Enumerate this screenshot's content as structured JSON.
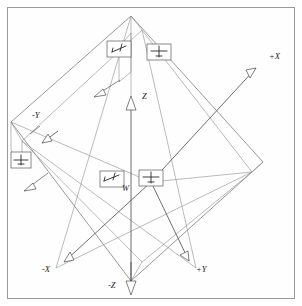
{
  "figure": {
    "background_color": "#ffffff",
    "border_color": "#9a9a9a",
    "line_color": "#6f6f6f",
    "axis_color": "#4a4a4a",
    "text_color": "#1a1a1a"
  },
  "axes": [
    {
      "id": "plus-x",
      "label": "+X",
      "sign": "+",
      "name": "X",
      "direction": "upper-right",
      "tip": [
        263,
        62
      ],
      "origin": [
        151,
        182
      ],
      "label_pos": [
        271,
        58
      ]
    },
    {
      "id": "minus-x",
      "label": "-X",
      "sign": "-",
      "name": "X",
      "direction": "lower-left",
      "tip": [
        56,
        268
      ],
      "origin": [
        151,
        182
      ],
      "label_pos": [
        44,
        271
      ]
    },
    {
      "id": "plus-y",
      "label": "+Y",
      "sign": "+",
      "name": "Y",
      "direction": "lower-right",
      "tip": [
        196,
        268
      ],
      "origin": [
        151,
        182
      ],
      "label_pos": [
        198,
        271
      ]
    },
    {
      "id": "minus-y",
      "label": "-Y",
      "sign": "-",
      "name": "Y",
      "direction": "upper-left",
      "tip": [
        40,
        126
      ],
      "origin": [
        151,
        182
      ],
      "label_pos": [
        33,
        114
      ]
    },
    {
      "id": "plus-z",
      "label": "Z",
      "sign": "+",
      "name": "Z",
      "direction": "up",
      "tip": [
        131,
        96
      ],
      "origin": [
        131,
        280
      ],
      "label_pos": [
        143,
        97
      ]
    },
    {
      "id": "minus-z",
      "label": "-Z",
      "sign": "-",
      "name": "Z",
      "direction": "down",
      "tip": [
        131,
        293
      ],
      "origin": [
        131,
        96
      ],
      "label_pos": [
        110,
        287
      ]
    }
  ],
  "view_icons": [
    {
      "id": "icon-top-left",
      "view": "side-view-left",
      "glyph": "aircraft-side",
      "x": 107,
      "y": 41,
      "w": 24,
      "h": 16
    },
    {
      "id": "icon-top-right",
      "view": "front-view",
      "glyph": "aircraft-front",
      "x": 147,
      "y": 44,
      "w": 24,
      "h": 16
    },
    {
      "id": "icon-center-left",
      "view": "side-view-center",
      "glyph": "aircraft-side",
      "x": 100,
      "y": 171,
      "w": 24,
      "h": 16
    },
    {
      "id": "icon-center-right",
      "view": "top-view",
      "glyph": "aircraft-top",
      "x": 139,
      "y": 170,
      "w": 24,
      "h": 16
    },
    {
      "id": "icon-left-edge",
      "view": "rear-view",
      "glyph": "aircraft-rear",
      "x": 11,
      "y": 152,
      "w": 20,
      "h": 16
    }
  ],
  "vectors": [
    {
      "id": "vector-upper",
      "label": "",
      "from": [
        119,
        82
      ],
      "to": [
        95,
        97
      ]
    },
    {
      "id": "vector-lower",
      "label": "",
      "from": [
        50,
        175
      ],
      "to": [
        26,
        190
      ]
    },
    {
      "id": "vector-minus-y",
      "label": "",
      "from": [
        40,
        126
      ],
      "to": [
        22,
        140
      ]
    }
  ],
  "center_label": {
    "id": "body-label",
    "text": "W",
    "pos": [
      124,
      188
    ]
  },
  "wireframe": {
    "description": "isometric rectangular box (diamond orientation) enclosing the body",
    "vertices": {
      "top": [
        131,
        16
      ],
      "right": [
        263,
        162
      ],
      "bottom": [
        131,
        281
      ],
      "left": [
        11,
        122
      ],
      "inner_top": [
        142,
        30
      ],
      "inner_right": [
        252,
        172
      ],
      "inner_left": [
        22,
        142
      ],
      "inner_bottom": [
        142,
        262
      ]
    }
  }
}
